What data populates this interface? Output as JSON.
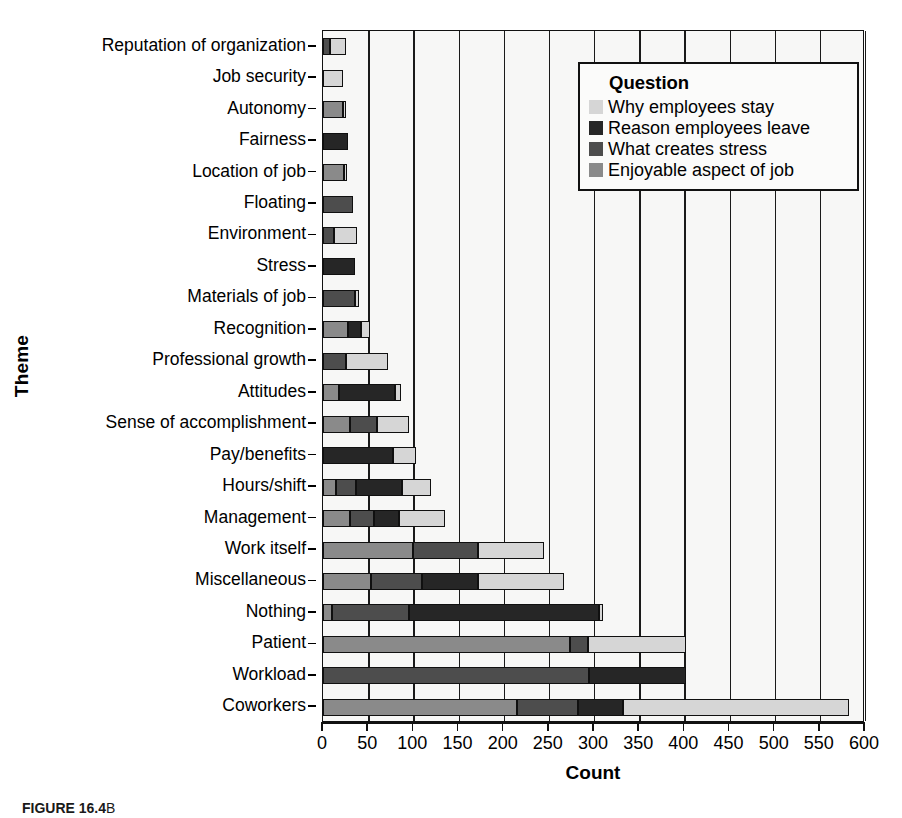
{
  "chart_data": {
    "type": "bar",
    "orientation": "horizontal",
    "stacked": true,
    "title": "",
    "xlabel": "Count",
    "ylabel": "Theme",
    "xlim": [
      0,
      600
    ],
    "xticks": [
      0,
      50,
      100,
      150,
      200,
      250,
      300,
      350,
      400,
      450,
      500,
      550,
      600
    ],
    "grid": true,
    "legend_title": "Question",
    "legend_position": "top-right",
    "categories": [
      "Reputation of organization",
      "Job security",
      "Autonomy",
      "Fairness",
      "Location of job",
      "Floating",
      "Environment",
      "Stress",
      "Materials of job",
      "Recognition",
      "Professional growth",
      "Attitudes",
      "Sense of accomplishment",
      "Pay/benefits",
      "Hours/shift",
      "Management",
      "Work itself",
      "Miscellaneous",
      "Nothing",
      "Patient",
      "Workload",
      "Coworkers"
    ],
    "series": [
      {
        "name": "Enjoyable aspect of job",
        "color": "#8a8a8a",
        "values": [
          0,
          0,
          22,
          0,
          23,
          0,
          0,
          0,
          0,
          28,
          0,
          18,
          30,
          0,
          14,
          30,
          100,
          53,
          10,
          273,
          0,
          215
        ]
      },
      {
        "name": "What creates stress",
        "color": "#4d4d4d",
        "values": [
          8,
          0,
          0,
          0,
          0,
          33,
          12,
          0,
          35,
          0,
          26,
          0,
          30,
          0,
          22,
          26,
          72,
          57,
          85,
          20,
          294,
          67
        ]
      },
      {
        "name": "Reason employees leave",
        "color": "#262626",
        "values": [
          0,
          0,
          0,
          28,
          0,
          0,
          0,
          35,
          0,
          14,
          0,
          62,
          0,
          78,
          52,
          28,
          0,
          62,
          210,
          0,
          108,
          50
        ]
      },
      {
        "name": "Why employees stay",
        "color": "#d6d6d6",
        "values": [
          17,
          22,
          3,
          0,
          2,
          0,
          26,
          0,
          5,
          10,
          46,
          6,
          35,
          25,
          32,
          51,
          73,
          95,
          5,
          109,
          0,
          250
        ]
      }
    ],
    "stack_order": [
      "Enjoyable aspect of job",
      "What creates stress",
      "Reason employees leave",
      "Why employees stay"
    ],
    "totals": [
      25,
      22,
      25,
      28,
      25,
      33,
      38,
      35,
      40,
      52,
      72,
      86,
      95,
      103,
      120,
      135,
      245,
      267,
      310,
      402,
      402,
      582
    ]
  },
  "legend": {
    "title": "Question",
    "entries": [
      {
        "label": "Why employees stay",
        "color": "#d6d6d6"
      },
      {
        "label": "Reason employees leave",
        "color": "#262626"
      },
      {
        "label": "What creates stress",
        "color": "#4d4d4d"
      },
      {
        "label": "Enjoyable aspect of job",
        "color": "#8a8a8a"
      }
    ]
  },
  "axes": {
    "x_title": "Count",
    "y_title": "Theme"
  },
  "caption": {
    "figure_label": "FIGURE 16.4",
    "text": "B"
  }
}
